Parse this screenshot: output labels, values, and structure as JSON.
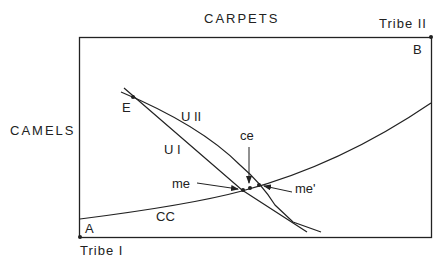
{
  "diagram": {
    "type": "edgeworth-box",
    "top_axis_label": "CARPETS",
    "left_axis_label": "CAMELS",
    "origin_bottom_left": "Tribe I",
    "origin_top_right": "Tribe II",
    "corner_labels": {
      "bottom_left": "A",
      "top_right": "B"
    },
    "points": {
      "endowment": "E",
      "market_equilibrium": "me",
      "market_equilibrium_alt": "me'",
      "competitive_equilibrium": "ce"
    },
    "curves": {
      "contract_curve": "CC",
      "indifference_tribe_1": "U I",
      "indifference_tribe_2": "U II"
    },
    "colors": {
      "line": "#222222",
      "background": "#ffffff"
    }
  }
}
